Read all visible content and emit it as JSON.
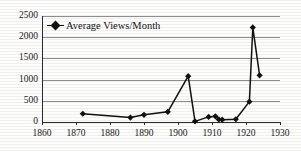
{
  "chart_data": {
    "type": "line",
    "title": "",
    "xlabel": "",
    "ylabel": "",
    "xlim": [
      1860,
      1930
    ],
    "ylim": [
      0,
      2500
    ],
    "xticks": [
      1860,
      1870,
      1880,
      1890,
      1900,
      1910,
      1920,
      1930
    ],
    "yticks": [
      0,
      500,
      1000,
      1500,
      2000,
      2500
    ],
    "grid": "horizontal",
    "legend_position": "top-left",
    "marker": "filled-diamond",
    "line_color": "#111111",
    "grid_color": "#8d8d8d",
    "series": [
      {
        "name": "Average Views/Month",
        "x": [
          1872,
          1886,
          1890,
          1897,
          1903,
          1905,
          1909,
          1911,
          1912,
          1913,
          1917,
          1921,
          1922,
          1924
        ],
        "values": [
          195,
          105,
          170,
          240,
          1080,
          15,
          120,
          135,
          60,
          55,
          65,
          480,
          2230,
          1100
        ]
      }
    ]
  },
  "legend": {
    "series_label": "Average Views/Month"
  },
  "axes": {
    "y_tick_labels": [
      "2500",
      "2000",
      "1500",
      "1000",
      "500",
      "0"
    ],
    "x_tick_labels": [
      "1860",
      "1870",
      "1880",
      "1890",
      "1900",
      "1910",
      "1920",
      "1930"
    ]
  }
}
